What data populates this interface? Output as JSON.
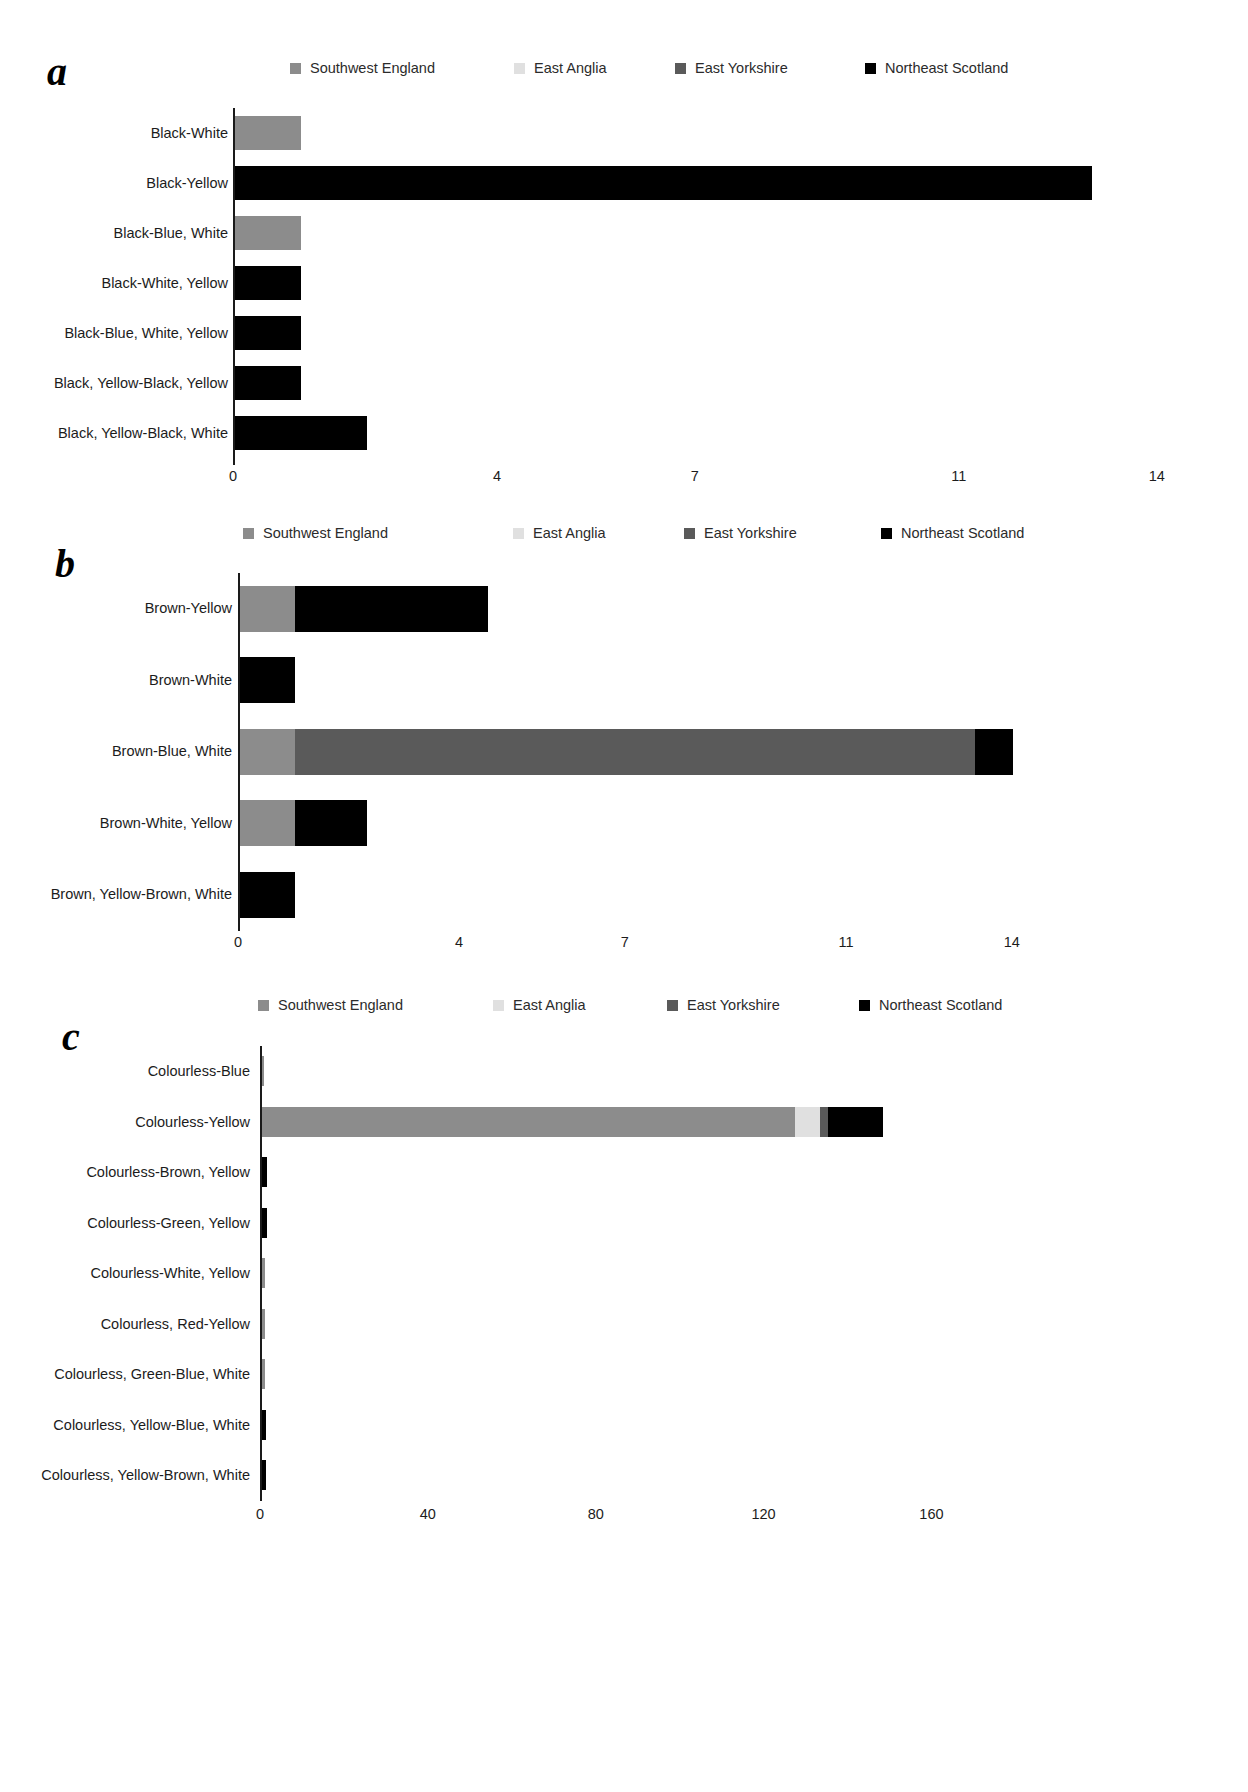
{
  "figure": {
    "legend_entries": [
      {
        "label": "Southwest England",
        "color": "#8c8c8c",
        "key": "southwest_england"
      },
      {
        "label": "East Anglia",
        "color": "#e0e0e0",
        "key": "east_anglia"
      },
      {
        "label": "East Yorkshire",
        "color": "#5a5a5a",
        "key": "east_yorkshire"
      },
      {
        "label": "Northeast Scotland",
        "color": "#000000",
        "key": "northeast_scotland"
      }
    ]
  },
  "panels": [
    {
      "letter": "a",
      "chart_data": {
        "type": "bar",
        "title": "",
        "xlabel": "",
        "ylabel": "",
        "stacked": true,
        "orientation": "horizontal",
        "xlim": [
          0,
          15.2
        ],
        "grid": false,
        "legend_position": "top",
        "ticks": [
          {
            "value": 0,
            "label": "0"
          },
          {
            "value": 4,
            "label": "4"
          },
          {
            "value": 7,
            "label": "7"
          },
          {
            "value": 11,
            "label": "11"
          },
          {
            "value": 14,
            "label": "14"
          }
        ],
        "categories": [
          "Black-White",
          "Black-Yellow",
          "Black-Blue, White",
          "Black-White, Yellow",
          "Black-Blue, White, Yellow",
          "Black, Yellow-Black, Yellow",
          "Black, Yellow-Black, White"
        ],
        "series": [
          {
            "name": "Southwest England",
            "color": "#8c8c8c",
            "values": [
              1,
              0,
              1,
              0,
              0,
              0,
              0
            ]
          },
          {
            "name": "East Anglia",
            "color": "#e0e0e0",
            "values": [
              0,
              0,
              0,
              0,
              0,
              0,
              0
            ]
          },
          {
            "name": "East Yorkshire",
            "color": "#5a5a5a",
            "values": [
              0,
              0,
              0,
              0,
              0,
              0,
              0
            ]
          },
          {
            "name": "Northeast Scotland",
            "color": "#000000",
            "values": [
              0,
              13,
              0,
              1,
              1,
              1,
              2
            ]
          }
        ]
      }
    },
    {
      "letter": "b",
      "chart_data": {
        "type": "bar",
        "title": "",
        "xlabel": "",
        "ylabel": "",
        "stacked": true,
        "orientation": "horizontal",
        "xlim": [
          0,
          14.6
        ],
        "grid": false,
        "legend_position": "top",
        "ticks": [
          {
            "value": 0,
            "label": "0"
          },
          {
            "value": 4,
            "label": "4"
          },
          {
            "value": 7,
            "label": "7"
          },
          {
            "value": 11,
            "label": "11"
          },
          {
            "value": 14,
            "label": "14"
          }
        ],
        "categories": [
          "Brown-Yellow",
          "Brown-White",
          "Brown-Blue, White",
          "Brown-White, Yellow",
          "Brown, Yellow-Brown, White"
        ],
        "series": [
          {
            "name": "Southwest England",
            "color": "#8c8c8c",
            "values": [
              1,
              0,
              1,
              1,
              0
            ]
          },
          {
            "name": "East Anglia",
            "color": "#e0e0e0",
            "values": [
              0,
              0,
              0,
              0,
              0
            ]
          },
          {
            "name": "East Yorkshire",
            "color": "#5a5a5a",
            "values": [
              0,
              0,
              12.3,
              0,
              0
            ]
          },
          {
            "name": "Northeast Scotland",
            "color": "#000000",
            "values": [
              3.5,
              1,
              0.7,
              1.3,
              1
            ]
          }
        ]
      }
    },
    {
      "letter": "c",
      "chart_data": {
        "type": "bar",
        "title": "",
        "xlabel": "",
        "ylabel": "",
        "stacked": true,
        "orientation": "horizontal",
        "xlim": [
          0,
          178
        ],
        "grid": false,
        "legend_position": "top",
        "ticks": [
          {
            "value": 0,
            "label": "0"
          },
          {
            "value": 40,
            "label": "40"
          },
          {
            "value": 80,
            "label": "80"
          },
          {
            "value": 120,
            "label": "120"
          },
          {
            "value": 160,
            "label": "160"
          }
        ],
        "categories": [
          "Colourless-Blue",
          "Colourless-Yellow",
          "Colourless-Brown, Yellow",
          "Colourless-Green, Yellow",
          "Colourless-White, Yellow",
          "Colourless, Red-Yellow",
          "Colourless, Green-Blue, White",
          "Colourless, Yellow-Blue, White",
          "Colourless, Yellow-Brown, White"
        ],
        "series": [
          {
            "name": "Southwest England",
            "color": "#8c8c8c",
            "values": [
              0.6,
              127,
              0,
              0,
              0.7,
              0.7,
              0.7,
              0,
              0
            ]
          },
          {
            "name": "East Anglia",
            "color": "#e0e0e0",
            "values": [
              0,
              6,
              0,
              0,
              0,
              0,
              0,
              0,
              0
            ]
          },
          {
            "name": "East Yorkshire",
            "color": "#5a5a5a",
            "values": [
              0,
              2,
              0,
              0,
              0,
              0,
              0,
              0,
              0
            ]
          },
          {
            "name": "Northeast Scotland",
            "color": "#000000",
            "values": [
              0,
              13,
              1.3,
              1.3,
              0,
              0,
              0,
              1.1,
              1.1
            ]
          }
        ]
      }
    }
  ]
}
